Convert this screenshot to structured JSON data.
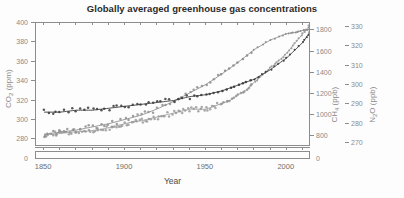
{
  "chart_data": {
    "type": "line",
    "title": "Globally averaged greenhouse gas concentrations",
    "xlabel": "Year",
    "xlim": [
      1845,
      2015
    ],
    "xticks": [
      1850,
      1900,
      1950,
      2000
    ],
    "xticks_minor": [
      1860,
      1870,
      1880,
      1890,
      1910,
      1920,
      1930,
      1940,
      1960,
      1970,
      1980,
      1990,
      2010
    ],
    "grid": false,
    "legend": "none",
    "axes": [
      {
        "id": "co2",
        "label": "CO2 (ppm)",
        "label_html": "CO<sub>2</sub> (ppm)",
        "side": "left",
        "ticks": [
          280,
          300,
          320,
          340,
          360,
          380,
          400
        ],
        "lim": [
          272,
          400
        ],
        "broken_zero_tick": "0"
      },
      {
        "id": "ch4",
        "label": "CH4 (ppb)",
        "label_html": "CH<sub>4</sub> (ppb)",
        "side": "right-inner",
        "ticks": [
          800,
          1000,
          1200,
          1400,
          1600,
          1800
        ],
        "lim": [
          700,
          1870
        ],
        "broken_zero_tick": "0"
      },
      {
        "id": "n2o",
        "label": "N2O (ppb)",
        "label_html": "N<sub>2</sub>O (ppb)",
        "side": "right-outer",
        "ticks": [
          270,
          280,
          290,
          300,
          310,
          320,
          330
        ],
        "lim": [
          268,
          332
        ]
      }
    ],
    "series": [
      {
        "name": "CO2",
        "axis": "co2",
        "unit": "ppm",
        "color": "#9a9a9a",
        "style": "scatter-then-line",
        "x": [
          1850,
          1855,
          1860,
          1865,
          1870,
          1875,
          1880,
          1885,
          1890,
          1895,
          1900,
          1905,
          1910,
          1915,
          1920,
          1925,
          1930,
          1935,
          1940,
          1945,
          1950,
          1955,
          1960,
          1965,
          1970,
          1975,
          1980,
          1985,
          1990,
          1995,
          2000,
          2005,
          2010,
          2014
        ],
        "values": [
          285,
          285,
          286,
          287,
          288,
          288,
          289,
          290,
          292,
          294,
          296,
          298,
          299,
          301,
          303,
          305,
          307,
          309,
          311,
          311,
          311,
          314,
          317,
          320,
          326,
          331,
          339,
          346,
          354,
          361,
          369,
          379,
          389,
          397
        ]
      },
      {
        "name": "CH4",
        "axis": "ch4",
        "unit": "ppb",
        "color": "#8e8e8e",
        "style": "scatter-then-line",
        "x": [
          1850,
          1860,
          1870,
          1880,
          1890,
          1900,
          1910,
          1920,
          1930,
          1940,
          1950,
          1960,
          1970,
          1980,
          1990,
          2000,
          2005,
          2010,
          2014
        ],
        "values": [
          820,
          840,
          860,
          890,
          920,
          960,
          1000,
          1060,
          1130,
          1210,
          1290,
          1390,
          1500,
          1620,
          1710,
          1770,
          1780,
          1800,
          1810
        ]
      },
      {
        "name": "N2O",
        "axis": "n2o",
        "unit": "ppb",
        "color": "#3a3a3a",
        "style": "scatter-then-line",
        "x": [
          1850,
          1860,
          1870,
          1880,
          1890,
          1900,
          1910,
          1920,
          1930,
          1940,
          1950,
          1960,
          1970,
          1980,
          1990,
          2000,
          2010,
          2014
        ],
        "values": [
          286,
          286,
          287,
          287,
          288,
          289,
          290,
          291,
          292,
          294,
          295,
          297,
          300,
          303,
          308,
          314,
          322,
          327
        ]
      }
    ]
  }
}
